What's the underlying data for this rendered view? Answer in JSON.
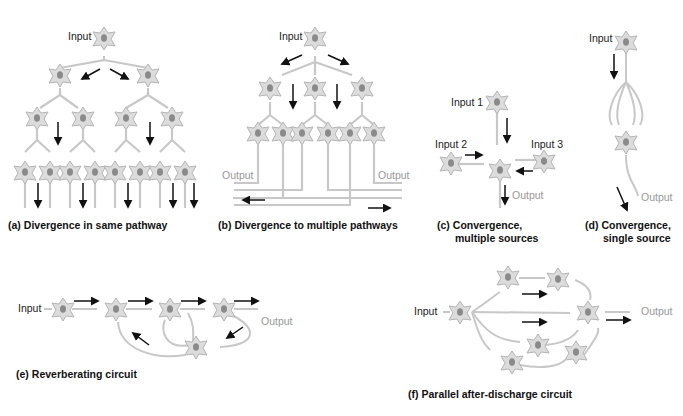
{
  "colors": {
    "neuron_fill": "#dcdcdc",
    "neuron_stroke": "#b5b5b5",
    "nucleus": "#8a8a8a",
    "arrow": "#111111",
    "output_text": "#999999"
  },
  "panels": {
    "a": {
      "tag": "(a)",
      "caption": "Divergence in same pathway",
      "labels": {
        "input": "Input"
      }
    },
    "b": {
      "tag": "(b)",
      "caption": "Divergence to multiple pathways",
      "labels": {
        "input": "Input",
        "output_left": "Output",
        "output_right": "Output"
      }
    },
    "c": {
      "tag": "(c)",
      "caption_line1": "Convergence,",
      "caption_line2": "multiple sources",
      "labels": {
        "input1": "Input 1",
        "input2": "Input 2",
        "input3": "Input 3",
        "output": "Output"
      }
    },
    "d": {
      "tag": "(d)",
      "caption_line1": "Convergence,",
      "caption_line2": "single source",
      "labels": {
        "input": "Input",
        "output": "Output"
      }
    },
    "e": {
      "tag": "(e)",
      "caption": "Reverberating circuit",
      "labels": {
        "input": "Input",
        "output": "Output"
      }
    },
    "f": {
      "tag": "(f)",
      "caption": "Parallel after-discharge circuit",
      "labels": {
        "input": "Input",
        "output": "Output"
      }
    }
  }
}
